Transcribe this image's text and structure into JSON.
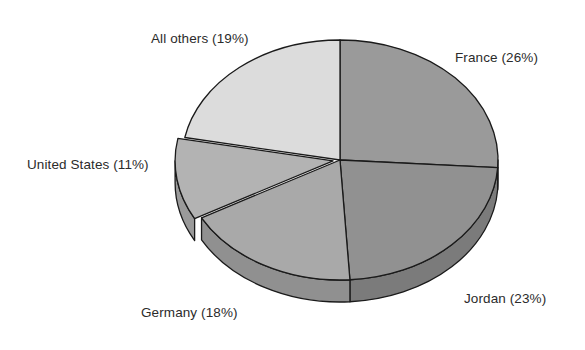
{
  "background": "#ffffff",
  "chart_data": {
    "type": "pie",
    "title": "",
    "subtitle": "",
    "xlabel": "",
    "ylabel": "",
    "legend_position": "none",
    "grid": false,
    "three_d": true,
    "labels_show_percent": true,
    "start_angle_deg": 0,
    "direction": "clockwise",
    "categories": [
      "France",
      "Jordan",
      "Germany",
      "United States",
      "All others"
    ],
    "values": [
      26,
      23,
      18,
      11,
      19
    ],
    "value_unit": "%",
    "annotations": [
      "France (26%)",
      "Jordan (23%)",
      "Germany (18%)",
      "United States (11%)",
      "All others (19%)"
    ],
    "slices": [
      {
        "name": "France",
        "label": "France (26%)",
        "value": 26,
        "color": "#9a9a9a",
        "side_color": "#838383",
        "exploded": false,
        "start_deg": 0,
        "end_deg": 93.6
      },
      {
        "name": "Jordan",
        "label": "Jordan (23%)",
        "value": 23,
        "color": "#919191",
        "side_color": "#7b7b7b",
        "exploded": false,
        "start_deg": 93.6,
        "end_deg": 176.4
      },
      {
        "name": "Germany",
        "label": "Germany (18%)",
        "value": 18,
        "color": "#a9a9a9",
        "side_color": "#909090",
        "exploded": false,
        "start_deg": 176.4,
        "end_deg": 241.2
      },
      {
        "name": "United States",
        "label": "United States (11%)",
        "value": 11,
        "color": "#b3b3b3",
        "side_color": "#9a9a9a",
        "exploded": true,
        "explode_offset_px": 7,
        "start_deg": 241.2,
        "end_deg": 280.8
      },
      {
        "name": "All others",
        "label": "All others (19%)",
        "value": 19,
        "color": "#dcdcdc",
        "side_color": "#bfbfbf",
        "exploded": false,
        "start_deg": 280.8,
        "end_deg": 360
      }
    ]
  },
  "labels": {
    "all_others": "All others (19%)",
    "france": "France (26%)",
    "united_states": "United States (11%)",
    "germany": "Germany (18%)",
    "jordan": "Jordan (23%)"
  },
  "colors": {
    "outline": "#1a1a1a",
    "text": "#2b2b2b",
    "background": "#ffffff",
    "france": "#9a9a9a",
    "jordan": "#919191",
    "germany": "#a9a9a9",
    "united_states": "#b3b3b3",
    "all_others": "#dcdcdc"
  }
}
